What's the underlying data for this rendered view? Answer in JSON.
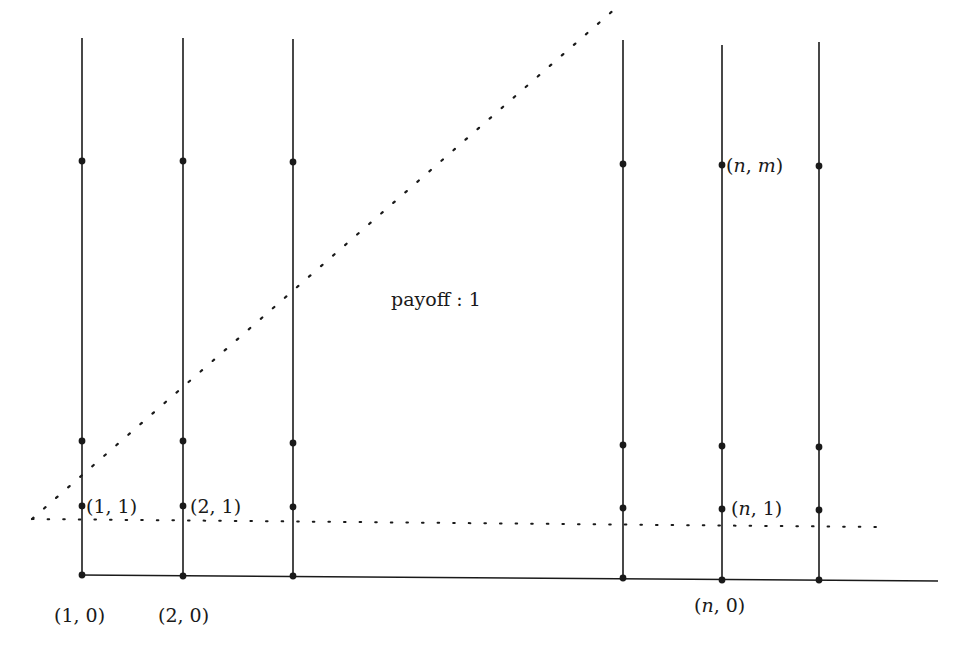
{
  "colors": {
    "ink": "#1a1a1a",
    "background": "#ffffff"
  },
  "region_label": "payoff : 1",
  "labels": {
    "p10": "(1, 0)",
    "p20": "(2, 0)",
    "pn0": "(n, 0)",
    "p11": "(1, 1)",
    "p21": "(2, 1)",
    "pn1": "(n, 1)",
    "pnm": "(n, m)"
  },
  "label_parts": {
    "p10": [
      "(",
      "1",
      ", ",
      "0",
      ")"
    ],
    "p20": [
      "(",
      "2",
      ", ",
      "0",
      ")"
    ],
    "pn0": [
      "(",
      "n",
      ", ",
      "0",
      ")"
    ],
    "p11": [
      "(",
      "1",
      ", ",
      "1",
      ")"
    ],
    "p21": [
      "(",
      "2",
      ", ",
      "1",
      ")"
    ],
    "pn1": [
      "(",
      "n",
      ", ",
      "1",
      ")"
    ],
    "pnm": [
      "(",
      "n",
      ", ",
      "m",
      ")"
    ]
  },
  "columns": [
    {
      "id": "col-1",
      "x": 82,
      "top": 38,
      "bottom": 575,
      "dots": [
        575,
        506,
        441,
        161
      ]
    },
    {
      "id": "col-2",
      "x": 183,
      "top": 38,
      "bottom": 576,
      "dots": [
        576,
        506,
        441,
        161
      ]
    },
    {
      "id": "col-3",
      "x": 293,
      "top": 39,
      "bottom": 576,
      "dots": [
        576,
        507,
        443,
        162
      ]
    },
    {
      "id": "col-n-minus",
      "x": 623,
      "top": 40,
      "bottom": 578,
      "dots": [
        578,
        508,
        445,
        164
      ]
    },
    {
      "id": "col-n",
      "x": 722,
      "top": 45,
      "bottom": 580,
      "dots": [
        580,
        509,
        446,
        165
      ]
    },
    {
      "id": "col-n-plus",
      "x": 819,
      "top": 42,
      "bottom": 580,
      "dots": [
        580,
        510,
        447,
        166
      ]
    }
  ],
  "baseline": {
    "x1": 80,
    "y1": 575,
    "x2": 938,
    "y2": 581
  },
  "dotted_horizontal": {
    "x1": 32,
    "y1": 519,
    "x2": 880,
    "y2": 527
  },
  "dotted_diagonal": {
    "x1": 32,
    "y1": 519,
    "x2": 616,
    "y2": 8
  }
}
